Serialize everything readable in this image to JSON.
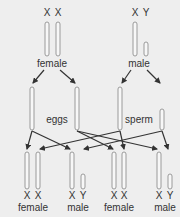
{
  "colors": {
    "background": "#eeeeee",
    "chromosome_fill": "#f7f7f7",
    "chromosome_stroke": "#9a9a9a",
    "arrow": "#333333",
    "text": "#333333"
  },
  "parents": {
    "female": {
      "label": "female",
      "chromosomes": [
        "X",
        "X"
      ]
    },
    "male": {
      "label": "male",
      "chromosomes": [
        "X",
        "Y"
      ]
    }
  },
  "gametes": {
    "eggs": {
      "label": "eggs"
    },
    "sperm": {
      "label": "sperm"
    }
  },
  "offspring": [
    {
      "label": "female",
      "chromosomes": [
        "X",
        "X"
      ]
    },
    {
      "label": "male",
      "chromosomes": [
        "X",
        "Y"
      ]
    },
    {
      "label": "female",
      "chromosomes": [
        "X",
        "X"
      ]
    },
    {
      "label": "male",
      "chromosomes": [
        "X",
        "Y"
      ]
    }
  ]
}
